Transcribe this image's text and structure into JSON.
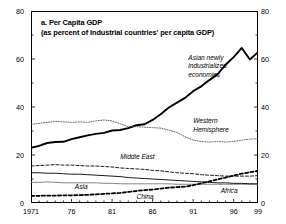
{
  "chart_data": {
    "type": "line",
    "title": "a. Per Capita GDP",
    "subtitle": "(as percent of Industrial countries' per capita GDP)",
    "xlabel": "",
    "ylabel": "",
    "xlim": [
      1971,
      1999
    ],
    "ylim": [
      0,
      80
    ],
    "grid": false,
    "legend": "inline-annotations",
    "y_ticks": [
      0,
      20,
      40,
      60,
      80
    ],
    "y_minor_step": 10,
    "y_ticks_left": [
      "0",
      "20",
      "40",
      "60",
      "80"
    ],
    "y_ticks_right": [
      "0",
      "20",
      "40",
      "60",
      "80"
    ],
    "x_ticks": [
      1971,
      1976,
      1981,
      1986,
      1991,
      1996,
      1999
    ],
    "x_tick_labels": [
      "1971",
      "76",
      "81",
      "86",
      "91",
      "96",
      "99"
    ],
    "x_minor_step": 1,
    "x": [
      1971,
      1972,
      1973,
      1974,
      1975,
      1976,
      1977,
      1978,
      1979,
      1980,
      1981,
      1982,
      1983,
      1984,
      1985,
      1986,
      1987,
      1988,
      1989,
      1990,
      1991,
      1992,
      1993,
      1994,
      1995,
      1996,
      1997,
      1998,
      1999
    ],
    "series": [
      {
        "name": "Asian newly industrialized economies",
        "style": "bold-solid",
        "color": "#000000",
        "label_x": 1990.4,
        "label_y": 60.5,
        "values": [
          23.0,
          23.8,
          25.0,
          25.4,
          25.5,
          26.6,
          27.4,
          28.2,
          28.8,
          29.2,
          30.2,
          30.4,
          31.2,
          32.4,
          32.8,
          34.6,
          37.0,
          39.8,
          41.8,
          43.8,
          46.6,
          48.6,
          51.2,
          53.6,
          57.6,
          60.8,
          64.6,
          59.8,
          62.8
        ]
      },
      {
        "name": "Western Hemisphere",
        "style": "fine-dotted",
        "color": "#555555",
        "label_x": 1991.0,
        "label_y": 34.0,
        "values": [
          32.8,
          33.2,
          33.6,
          34.0,
          33.8,
          33.6,
          33.8,
          33.6,
          34.2,
          34.6,
          34.2,
          33.0,
          31.8,
          31.8,
          31.6,
          31.4,
          31.2,
          30.4,
          29.4,
          27.6,
          26.2,
          25.6,
          25.4,
          25.6,
          25.4,
          25.6,
          26.2,
          26.6,
          26.8
        ]
      },
      {
        "name": "Middle East",
        "style": "dashed",
        "color": "#000000",
        "label_x": 1982.0,
        "label_y": 19.0,
        "values": [
          15.4,
          15.6,
          15.8,
          16.0,
          15.8,
          15.8,
          15.6,
          15.4,
          15.4,
          15.2,
          15.0,
          14.6,
          14.4,
          14.2,
          14.0,
          13.6,
          13.4,
          13.0,
          12.6,
          12.4,
          12.2,
          11.8,
          11.6,
          11.4,
          11.2,
          11.2,
          11.2,
          11.2,
          11.4
        ]
      },
      {
        "name": "Asia",
        "style": "thin-solid",
        "color": "#777777",
        "label_x": 1976.4,
        "label_y": 6.6,
        "values": [
          8.6,
          8.6,
          8.8,
          8.6,
          8.4,
          8.4,
          8.4,
          8.4,
          8.4,
          8.2,
          8.2,
          8.0,
          8.0,
          8.0,
          8.0,
          8.0,
          8.0,
          8.0,
          7.8,
          7.8,
          7.8,
          7.8,
          7.8,
          7.8,
          7.8,
          7.8,
          7.8,
          7.8,
          7.8
        ]
      },
      {
        "name": "Africa",
        "style": "thin-solid",
        "color": "#000000",
        "label_x": 1994.4,
        "label_y": 5.2,
        "values": [
          12.6,
          12.6,
          12.4,
          12.4,
          12.2,
          12.0,
          12.0,
          11.8,
          11.6,
          11.4,
          11.2,
          11.0,
          10.6,
          10.4,
          10.2,
          10.0,
          9.8,
          9.6,
          9.4,
          9.2,
          9.0,
          8.8,
          8.6,
          8.4,
          8.4,
          8.2,
          8.2,
          8.0,
          8.0
        ]
      },
      {
        "name": "China",
        "style": "bold-dashed",
        "color": "#000000",
        "label_x": 1984.0,
        "label_y": 2.6,
        "values": [
          3.0,
          3.0,
          3.1,
          3.1,
          3.2,
          3.2,
          3.3,
          3.4,
          3.6,
          3.8,
          4.0,
          4.2,
          4.6,
          5.0,
          5.4,
          5.6,
          6.0,
          6.4,
          6.6,
          6.8,
          7.4,
          8.2,
          9.0,
          9.8,
          10.6,
          11.4,
          12.2,
          12.8,
          13.4
        ]
      }
    ],
    "series_labels": {
      "asian_nie": [
        "Asian newly",
        "industrialized",
        "economies"
      ],
      "western_hemisphere": [
        "Western",
        "Hemisphere"
      ],
      "middle_east": [
        "Middle East"
      ],
      "asia": [
        "Asia"
      ],
      "africa": [
        "Africa"
      ],
      "china": [
        "China"
      ]
    }
  }
}
